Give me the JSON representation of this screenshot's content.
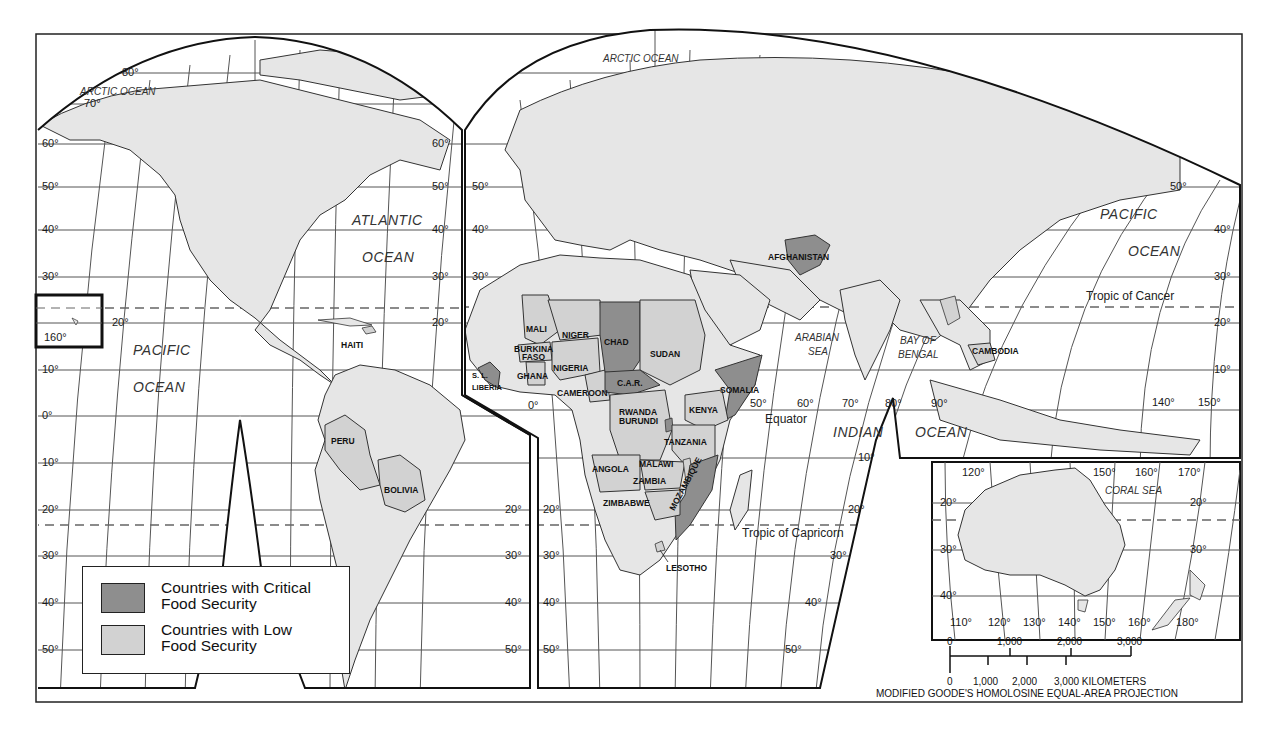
{
  "map": {
    "projection": "MODIFIED GOODE'S HOMOLOSINE EQUAL-AREA PROJECTION",
    "colors": {
      "critical": "#8e8e8e",
      "low": "#d2d2d2",
      "land": "#e6e6e6",
      "water": "#ffffff",
      "border": "#333333"
    },
    "legend": {
      "items": [
        {
          "label_line1": "Countries with Critical",
          "label_line2": "Food Security",
          "color": "#8e8e8e"
        },
        {
          "label_line1": "Countries with Low",
          "label_line2": "Food Security",
          "color": "#d2d2d2"
        }
      ]
    },
    "oceans": {
      "arctic_west": "ARCTIC OCEAN",
      "arctic_east": "ARCTIC OCEAN",
      "atlantic_1": "ATLANTIC",
      "atlantic_2": "OCEAN",
      "pacific_west_1": "PACIFIC",
      "pacific_west_2": "OCEAN",
      "pacific_east_1": "PACIFIC",
      "pacific_east_2": "OCEAN",
      "indian_1": "INDIAN",
      "indian_2": "OCEAN",
      "arabian_1": "ARABIAN",
      "arabian_2": "SEA",
      "bengal_1": "BAY OF",
      "bengal_2": "BENGAL",
      "coral": "CORAL   SEA"
    },
    "lines": {
      "tropic_cancer": "Tropic of Cancer",
      "tropic_capricorn": "Tropic of Capricorn",
      "equator": "Equator"
    },
    "countries": {
      "critical": [
        "CHAD",
        "C.A.R.",
        "SOMALIA",
        "AFGHANISTAN",
        "MOZAMBIQUE",
        "S. L.",
        "LIBERIA",
        "RWANDA",
        "BURUNDI"
      ],
      "low": [
        "HAITI",
        "PERU",
        "BOLIVIA",
        "MALI",
        "NIGER",
        "BURKINA",
        "FASO",
        "GHANA",
        "NIGERIA",
        "CAMEROON",
        "SUDAN",
        "KENYA",
        "TANZANIA",
        "ANGOLA",
        "MALAWI",
        "ZAMBIA",
        "ZIMBABWE",
        "LESOTHO",
        "CAMBODIA"
      ]
    },
    "labels": {
      "haiti": "HAITI",
      "peru": "PERU",
      "bolivia": "BOLIVIA",
      "mali": "MALI",
      "niger": "NIGER",
      "burkina": "BURKINA",
      "faso": "FASO",
      "ghana": "GHANA",
      "nigeria": "NIGERIA",
      "cameroon": "CAMEROON",
      "chad": "CHAD",
      "sudan": "SUDAN",
      "car": "C.A.R.",
      "somalia": "SOMALIA",
      "kenya": "KENYA",
      "rwanda": "RWANDA",
      "burundi": "BURUNDI",
      "tanzania": "TANZANIA",
      "angola": "ANGOLA",
      "malawi": "MALAWI",
      "zambia": "ZAMBIA",
      "zimbabwe": "ZIMBABWE",
      "mozambique": "MOZAMBIQUE",
      "lesotho": "LESOTHO",
      "sl": "S. L.",
      "liberia": "LIBERIA",
      "afghanistan": "AFGHANISTAN",
      "cambodia": "CAMBODIA"
    },
    "degrees": {
      "west_lat": [
        "80°",
        "70°",
        "60°",
        "50°",
        "40°",
        "30°",
        "20°",
        "10°",
        "0°",
        "10°",
        "20°",
        "30°",
        "40°",
        "50°"
      ],
      "west_lat_right": [
        "60°",
        "50°",
        "40°",
        "30°",
        "20°"
      ],
      "hawaii_lon": "160°",
      "hawaii_lat": "20°",
      "africa_lat_left": [
        "50°",
        "40°",
        "30°",
        "20°",
        "30°",
        "40°",
        "50°"
      ],
      "africa_lat_south": [
        "20°",
        "30°",
        "40°",
        "50°"
      ],
      "africa_lat_south_right": [
        "10°",
        "20°",
        "30°",
        "40°",
        "50°"
      ],
      "prime": "0°",
      "lon_equator": [
        "50°",
        "60°",
        "70°",
        "80°",
        "90°"
      ],
      "east_lat_right": [
        "50°",
        "40°",
        "30°",
        "20°",
        "10°"
      ],
      "east_lon": [
        "140°",
        "150°"
      ],
      "aus_top_lon": [
        "120°",
        "150°",
        "160°",
        "170°"
      ],
      "aus_lat_left": [
        "20°",
        "30°",
        "40°"
      ],
      "aus_lat_right": [
        "20°",
        "30°"
      ],
      "aus_bottom_lon": [
        "110°",
        "120°",
        "130°",
        "140°",
        "150°",
        "160°",
        "180°"
      ]
    },
    "scale": {
      "miles_ticks": [
        "0",
        "1,000",
        "2,000",
        "3,000"
      ],
      "km_ticks": [
        "0",
        "1,000",
        "2,000"
      ],
      "km_last": "3,000 KILOMETERS"
    }
  }
}
